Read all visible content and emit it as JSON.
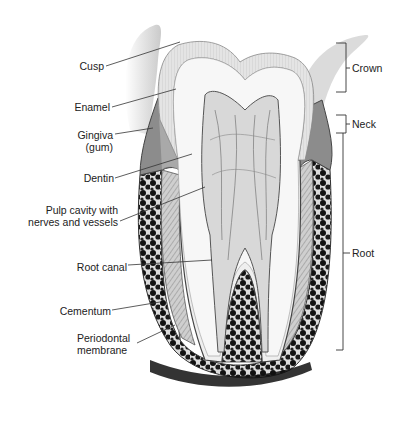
{
  "figure": {
    "left_labels": [
      {
        "id": "cusp",
        "text": "Cusp"
      },
      {
        "id": "enamel",
        "text": "Enamel"
      },
      {
        "id": "gingiva",
        "text": "Gingiva",
        "text2": "(gum)"
      },
      {
        "id": "dentin",
        "text": "Dentin"
      },
      {
        "id": "pulp",
        "text": "Pulp cavity with",
        "text2": "nerves and vessels"
      },
      {
        "id": "root-canal",
        "text": "Root canal"
      },
      {
        "id": "cementum",
        "text": "Cementum"
      },
      {
        "id": "periodontal",
        "text": "Periodontal",
        "text2": "membrane"
      }
    ],
    "right_labels": [
      {
        "id": "crown",
        "text": "Crown"
      },
      {
        "id": "neck",
        "text": "Neck"
      },
      {
        "id": "root",
        "text": "Root"
      }
    ],
    "colors": {
      "enamel": "#e6e6e6",
      "dentin": "#f6f6f6",
      "pulp": "#d4d4d4",
      "gum": "#9a9a9a",
      "bone": "#1a1a1a",
      "line": "#333333"
    }
  }
}
